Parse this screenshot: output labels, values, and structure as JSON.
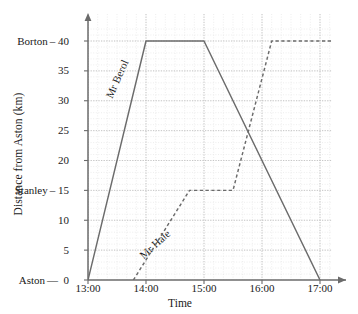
{
  "chart_data": {
    "type": "line",
    "title": "",
    "xlabel": "Time",
    "ylabel": "Distance from Aston (km)",
    "xlim": [
      13.0,
      17.2
    ],
    "ylim": [
      0,
      42
    ],
    "grid": true,
    "legend_position": "inline-labels",
    "x_tick_labels": [
      "13:00",
      "14:00",
      "15:00",
      "16:00",
      "17:00"
    ],
    "x_tick_values": [
      13,
      14,
      15,
      16,
      17
    ],
    "y_tick_labels": [
      "0",
      "5",
      "10",
      "15",
      "20",
      "25",
      "30",
      "35",
      "40"
    ],
    "y_tick_values": [
      0,
      5,
      10,
      15,
      20,
      25,
      30,
      35,
      40
    ],
    "y_place_labels": [
      {
        "value": 0,
        "place": "Aston"
      },
      {
        "value": 15,
        "place": "Stanley"
      },
      {
        "value": 40,
        "place": "Borton"
      }
    ],
    "minor_grid_x_step_minutes": 10,
    "minor_grid_y_step_km": 1,
    "series": [
      {
        "name": "Mr Berol",
        "style": "solid",
        "color": "#6b6b6b",
        "x": [
          13.0,
          14.0,
          15.0,
          17.0
        ],
        "y": [
          0,
          40,
          40,
          0
        ]
      },
      {
        "name": "Mr Hale",
        "style": "dashed",
        "color": "#6b6b6b",
        "x": [
          13.783,
          14.75,
          15.5,
          16.167,
          17.2
        ],
        "y": [
          0,
          15,
          15,
          40,
          40
        ]
      }
    ]
  },
  "annotations": {
    "berol_label": "Mr Berol",
    "hale_label": "Mr Hale"
  },
  "axes": {
    "y_title": "Distance from Aston (km)",
    "x_title": "Time"
  },
  "colors": {
    "line": "#6b6b6b",
    "axis": "#6b6b6b",
    "grid_major": "#c9c9c9",
    "grid_minor": "#e0e0e0",
    "text": "#1a1a1a",
    "background": "#ffffff"
  }
}
